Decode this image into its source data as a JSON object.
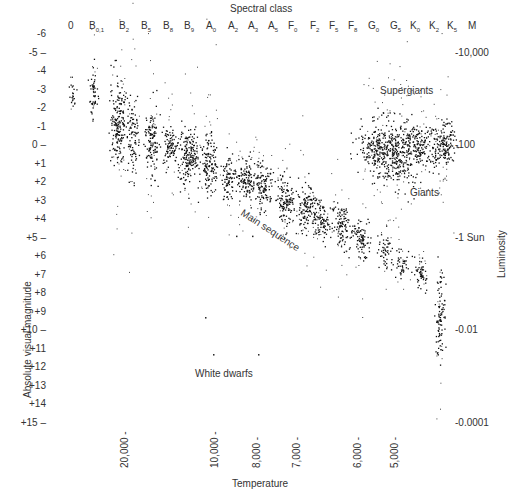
{
  "chart_data": {
    "type": "scatter",
    "title": "Spectral class",
    "xlabel": "Temperature",
    "ylabel": "Absolute visual magnitude",
    "y2label": "Luminosity",
    "spectral_classes": [
      {
        "label": "0",
        "sub": "",
        "x": 72
      },
      {
        "label": "B",
        "sub": "0,1",
        "x": 93
      },
      {
        "label": "B",
        "sub": "2",
        "x": 123
      },
      {
        "label": "B",
        "sub": "5",
        "x": 145
      },
      {
        "label": "B",
        "sub": "8",
        "x": 167
      },
      {
        "label": "B",
        "sub": "9",
        "x": 188
      },
      {
        "label": "A",
        "sub": "0",
        "x": 210
      },
      {
        "label": "A",
        "sub": "2",
        "x": 232
      },
      {
        "label": "A",
        "sub": "3",
        "x": 252
      },
      {
        "label": "A",
        "sub": "5",
        "x": 272
      },
      {
        "label": "F",
        "sub": "0",
        "x": 292
      },
      {
        "label": "F",
        "sub": "2",
        "x": 314
      },
      {
        "label": "F",
        "sub": "5",
        "x": 333
      },
      {
        "label": "F",
        "sub": "8",
        "x": 352
      },
      {
        "label": "G",
        "sub": "0",
        "x": 372
      },
      {
        "label": "G",
        "sub": "5",
        "x": 394
      },
      {
        "label": "K",
        "sub": "0",
        "x": 414
      },
      {
        "label": "K",
        "sub": "2",
        "x": 433
      },
      {
        "label": "K",
        "sub": "5",
        "x": 451
      },
      {
        "label": "M",
        "sub": "",
        "x": 472
      }
    ],
    "y_ticks": [
      "-6",
      "-5",
      "-4",
      "-3",
      "-2",
      "-1",
      "0",
      "+1",
      "+2",
      "+3",
      "+4",
      "+5",
      "+6",
      "+7",
      "+8",
      "+9",
      "+10",
      "+11",
      "+12",
      "+13",
      "+14",
      "+15"
    ],
    "y_range": [
      -6,
      15
    ],
    "luminosity_ticks": [
      {
        "label": "10,000",
        "mag": -5
      },
      {
        "label": "100",
        "mag": 0
      },
      {
        "label": "1 Sun",
        "mag": 5
      },
      {
        "label": "0.01",
        "mag": 10
      },
      {
        "label": "0.0001",
        "mag": 15
      }
    ],
    "temperature_ticks": [
      {
        "label": "20,000",
        "x": 125
      },
      {
        "label": "10,000",
        "x": 215
      },
      {
        "label": "8,000",
        "x": 257
      },
      {
        "label": "7,000",
        "x": 297
      },
      {
        "label": "6,000",
        "x": 358
      },
      {
        "label": "5,000",
        "x": 395
      }
    ],
    "annotations": [
      {
        "text": "Supergiants",
        "x": 380,
        "y": 85
      },
      {
        "text": "Giants",
        "x": 410,
        "y": 187
      },
      {
        "text": "Main sequence",
        "x": 245,
        "y": 207
      },
      {
        "text": "White dwarfs",
        "x": 195,
        "y": 368
      }
    ],
    "clusters": [
      {
        "cls": "0",
        "x": 72,
        "mag": -2.7,
        "sx": 1.5,
        "sy": 0.5,
        "n": 20
      },
      {
        "cls": "B0,1",
        "x": 93,
        "mag": -2.9,
        "sx": 2,
        "sy": 0.7,
        "n": 50
      },
      {
        "cls": "B2",
        "x": 118,
        "mag": -1.2,
        "sx": 4,
        "sy": 1.1,
        "n": 180
      },
      {
        "cls": "B5",
        "x": 132,
        "mag": -0.6,
        "sx": 3,
        "sy": 1.1,
        "n": 90
      },
      {
        "cls": "B8",
        "x": 151,
        "mag": -0.1,
        "sx": 3.5,
        "sy": 0.9,
        "n": 120
      },
      {
        "cls": "B9",
        "x": 169,
        "mag": 0.2,
        "sx": 3,
        "sy": 0.6,
        "n": 80
      },
      {
        "cls": "A0",
        "x": 188,
        "mag": 0.5,
        "sx": 6,
        "sy": 0.8,
        "n": 180
      },
      {
        "cls": "A2",
        "x": 209,
        "mag": 1.0,
        "sx": 4,
        "sy": 0.9,
        "n": 120
      },
      {
        "cls": "A3",
        "x": 228,
        "mag": 1.7,
        "sx": 3,
        "sy": 0.6,
        "n": 70
      },
      {
        "cls": "A5",
        "x": 245,
        "mag": 1.8,
        "sx": 6,
        "sy": 0.5,
        "n": 120
      },
      {
        "cls": "F0",
        "x": 262,
        "mag": 2.3,
        "sx": 5,
        "sy": 0.6,
        "n": 110
      },
      {
        "cls": "F2",
        "x": 285,
        "mag": 3.0,
        "sx": 5,
        "sy": 0.6,
        "n": 120
      },
      {
        "cls": "F5",
        "x": 305,
        "mag": 3.4,
        "sx": 5,
        "sy": 0.6,
        "n": 120
      },
      {
        "cls": "F8",
        "x": 322,
        "mag": 4.0,
        "sx": 5,
        "sy": 0.5,
        "n": 90
      },
      {
        "cls": "G0",
        "x": 342,
        "mag": 4.4,
        "sx": 5,
        "sy": 0.5,
        "n": 100
      },
      {
        "cls": "G5",
        "x": 360,
        "mag": 5.0,
        "sx": 5,
        "sy": 0.5,
        "n": 80
      },
      {
        "cls": "K0",
        "x": 385,
        "mag": 5.8,
        "sx": 4,
        "sy": 0.5,
        "n": 50
      },
      {
        "cls": "K2",
        "x": 402,
        "mag": 6.3,
        "sx": 4,
        "sy": 0.4,
        "n": 40
      },
      {
        "cls": "K5",
        "x": 420,
        "mag": 7.0,
        "sx": 3,
        "sy": 0.4,
        "n": 50
      },
      {
        "cls": "M",
        "x": 440,
        "mag": 9.2,
        "sx": 2.5,
        "sy": 1.2,
        "n": 90
      },
      {
        "cls": "Giants G5",
        "x": 380,
        "mag": 0.2,
        "sx": 12,
        "sy": 0.8,
        "n": 260
      },
      {
        "cls": "Giants K0",
        "x": 400,
        "mag": 0.5,
        "sx": 10,
        "sy": 0.9,
        "n": 200
      },
      {
        "cls": "Giants K2",
        "x": 420,
        "mag": 0.0,
        "sx": 10,
        "sy": 0.6,
        "n": 160
      },
      {
        "cls": "Giants K5",
        "x": 443,
        "mag": -0.1,
        "sx": 5,
        "sy": 0.6,
        "n": 140
      }
    ]
  }
}
